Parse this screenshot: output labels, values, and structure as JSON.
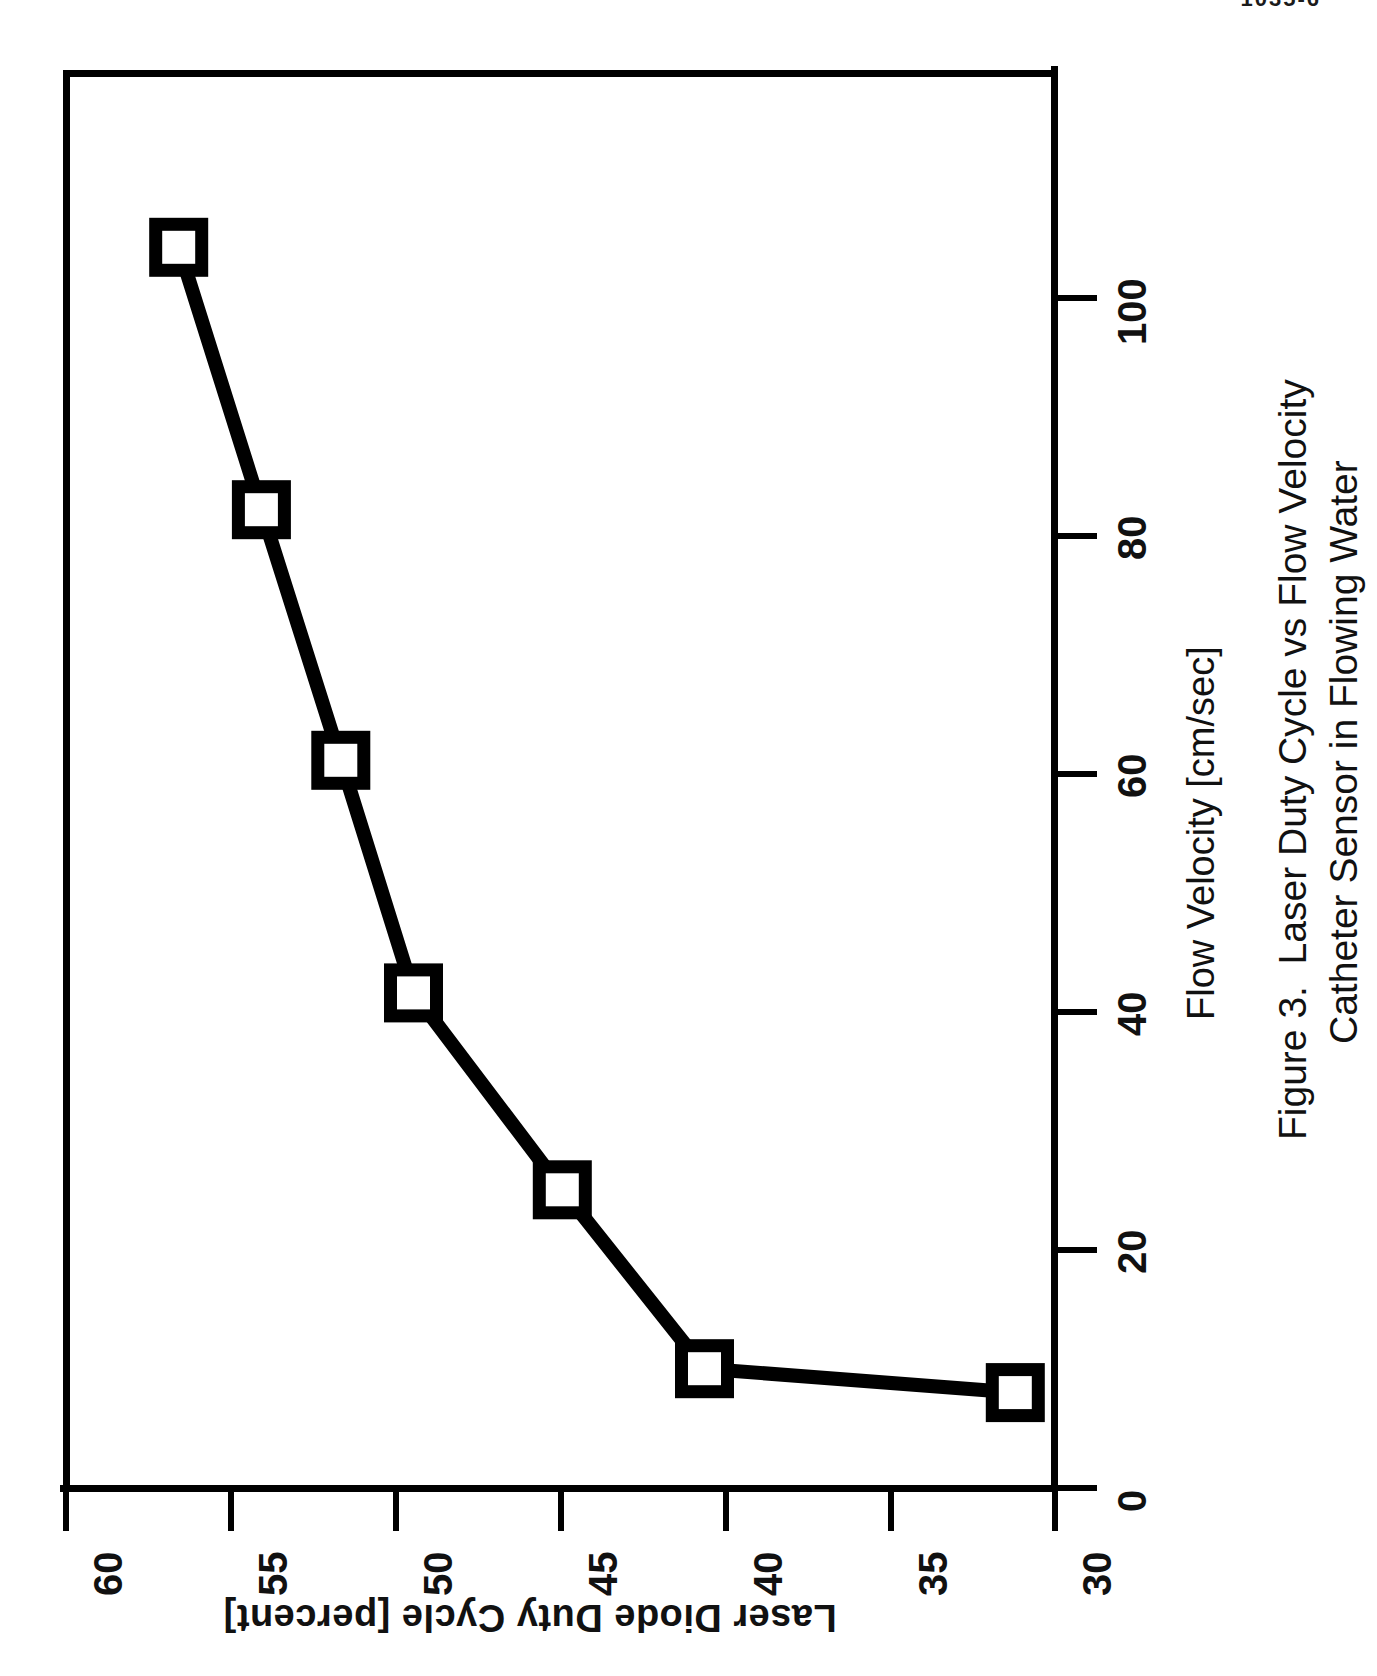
{
  "page": {
    "header_text": "1035-6"
  },
  "figure": {
    "caption_label": "Figure 3.",
    "caption_line1": "Laser Duty Cycle vs Flow Velocity",
    "caption_line2": "Catheter Sensor in Flowing Water",
    "orientation": "landscape-rotated-90ccw",
    "marker_style": "open-square",
    "line_color": "#000000",
    "marker_fill": "#ffffff",
    "background": "#ffffff"
  },
  "chart_data": {
    "type": "line",
    "title": "Laser Duty Cycle vs Flow Velocity  Catheter Sensor in Flowing Water",
    "xlabel": "Flow Velocity [cm/sec]",
    "ylabel": "Laser Diode Duty Cycle [percent]",
    "xlim": [
      0,
      112
    ],
    "ylim": [
      30,
      60
    ],
    "xticks": [
      0,
      20,
      40,
      60,
      80,
      100
    ],
    "xticklabels": [
      "0",
      "20",
      "40",
      "60",
      "80",
      "100"
    ],
    "yticks": [
      30,
      35,
      40,
      45,
      50,
      55,
      60
    ],
    "yticklabels": [
      "30",
      "35",
      "40",
      "45",
      "50",
      "55",
      "60"
    ],
    "grid": false,
    "legend": null,
    "series": [
      {
        "name": "Catheter Sensor in Flowing Water",
        "marker": "open-square",
        "x": [
          8,
          10,
          25,
          41.5,
          61,
          82,
          104
        ],
        "y": [
          31.2,
          40.6,
          44.9,
          49.4,
          51.6,
          54.0,
          56.5
        ]
      }
    ],
    "points": [
      {
        "flow_velocity": 8,
        "duty_cycle": 31.2
      },
      {
        "flow_velocity": 10,
        "duty_cycle": 40.6
      },
      {
        "flow_velocity": 25,
        "duty_cycle": 44.9
      },
      {
        "flow_velocity": 41.5,
        "duty_cycle": 49.4
      },
      {
        "flow_velocity": 61,
        "duty_cycle": 51.6
      },
      {
        "flow_velocity": 82,
        "duty_cycle": 54.0
      },
      {
        "flow_velocity": 104,
        "duty_cycle": 56.5
      }
    ]
  }
}
